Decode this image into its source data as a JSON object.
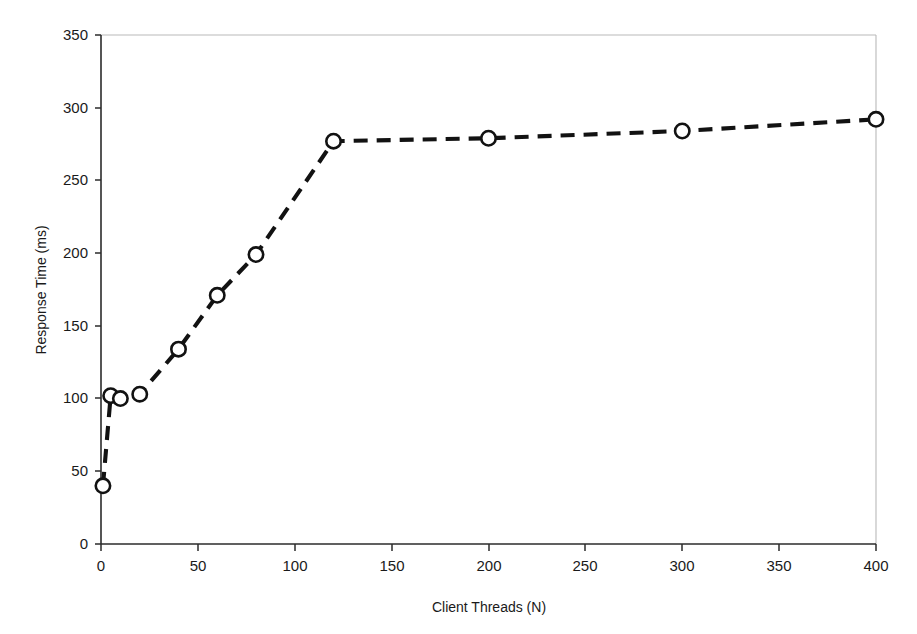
{
  "chart_data": {
    "type": "line",
    "title": "",
    "subtitle": "",
    "xlabel": "Client Threads (N)",
    "ylabel": "Response Time (ms)",
    "xlim": [
      0,
      400
    ],
    "ylim": [
      0,
      350
    ],
    "xticks": [
      0,
      50,
      100,
      150,
      200,
      250,
      300,
      350,
      400
    ],
    "yticks": [
      0,
      50,
      100,
      150,
      200,
      250,
      300,
      350
    ],
    "xtick_labels": [
      "0",
      "50",
      "100",
      "150",
      "200",
      "250",
      "300",
      "350",
      "400"
    ],
    "ytick_labels": [
      "0",
      "50",
      "100",
      "150",
      "200",
      "250",
      "300",
      "350"
    ],
    "grid": false,
    "legend": null,
    "annotations": [],
    "line_style": "dashed",
    "marker_style": "open-circle",
    "series": [
      {
        "name": "Response Time",
        "x": [
          1,
          5,
          10,
          20,
          40,
          60,
          80,
          120,
          200,
          300,
          400
        ],
        "values": [
          40,
          102,
          100,
          103,
          134,
          171,
          199,
          277,
          279,
          284,
          292
        ]
      }
    ]
  },
  "colors": {
    "line": "#121212",
    "marker_fill": "#ffffff",
    "marker_stroke": "#121212",
    "axis": "#2b2b2b",
    "frame": "#b9b9b9",
    "background": "#ffffff",
    "text": "#1a1a1a"
  }
}
